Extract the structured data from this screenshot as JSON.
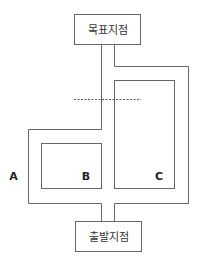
{
  "diagram": {
    "goal_label": "목표지점",
    "start_label": "출발지점",
    "route_labels": {
      "a": "A",
      "b": "B",
      "c": "C"
    },
    "colors": {
      "line": "#666666",
      "text": "#333333",
      "background": "#ffffff"
    }
  }
}
